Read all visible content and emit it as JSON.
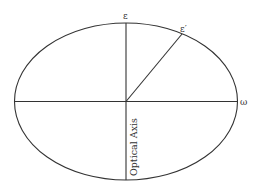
{
  "diagram": {
    "type": "index-ellipsoid",
    "labels": {
      "top": "ε",
      "diagonal": "ε′",
      "right": "ω",
      "axis": "Optical Axis"
    },
    "colors": {
      "stroke": "#333333",
      "background": "#ffffff"
    }
  }
}
